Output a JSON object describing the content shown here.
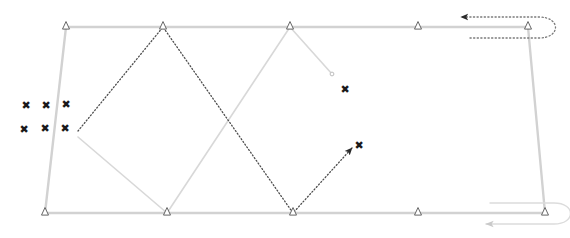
{
  "diagram": {
    "background_color": "#ffffff",
    "canvas": {
      "width": 570,
      "height": 238
    },
    "colors": {
      "boundary": "#d2d2d2",
      "pass_light": "#d8d8d8",
      "pass_dark": "#4d4d4d",
      "turn_dark": "#7a7a7a",
      "turn_light": "#dcdcdc",
      "marker_outline": "#555555",
      "marker_fill": "#ffffff",
      "obstacle": "#1a1a1a"
    }
  },
  "boundary": {
    "name": "field-boundary",
    "points": [
      {
        "x": 66,
        "y": 27
      },
      {
        "x": 528,
        "y": 27
      },
      {
        "x": 545,
        "y": 213
      },
      {
        "x": 45,
        "y": 213
      }
    ],
    "stroke_width": 2.4
  },
  "waypoints": {
    "top_row_label": "top-edge-waypoints",
    "bottom_row_label": "bottom-edge-waypoints",
    "top": [
      {
        "id": "t1",
        "x": 66,
        "y": 27
      },
      {
        "id": "t2",
        "x": 163,
        "y": 27
      },
      {
        "id": "t3",
        "x": 290,
        "y": 27
      },
      {
        "id": "t4",
        "x": 418,
        "y": 27
      },
      {
        "id": "t5",
        "x": 528,
        "y": 27
      }
    ],
    "bottom": [
      {
        "id": "b1",
        "x": 45,
        "y": 213
      },
      {
        "id": "b2",
        "x": 167,
        "y": 213
      },
      {
        "id": "b3",
        "x": 293,
        "y": 213
      },
      {
        "id": "b4",
        "x": 418,
        "y": 213
      },
      {
        "id": "b5",
        "x": 545,
        "y": 213
      }
    ],
    "marker_shape": "triangle-up-outline",
    "marker_size": 7
  },
  "coverage_paths": [
    {
      "name": "coverage-pass-light",
      "style": "solid",
      "color": "#d8d8d8",
      "stroke_width": 1.6,
      "points": [
        {
          "x": 78,
          "y": 137
        },
        {
          "x": 167,
          "y": 213
        },
        {
          "x": 290,
          "y": 27
        },
        {
          "x": 332,
          "y": 74
        }
      ],
      "end_marker": "dot",
      "end_point": {
        "x": 332,
        "y": 74
      }
    },
    {
      "name": "coverage-pass-dark",
      "style": "dotted",
      "color": "#4d4d4d",
      "stroke_width": 1.3,
      "points": [
        {
          "x": 78,
          "y": 131
        },
        {
          "x": 163,
          "y": 27
        },
        {
          "x": 293,
          "y": 213
        },
        {
          "x": 352,
          "y": 148
        }
      ],
      "end_marker": "arrow",
      "end_point": {
        "x": 352,
        "y": 148
      }
    }
  ],
  "turns": [
    {
      "name": "headland-turn-top-right",
      "style": "dotted",
      "color": "#7a7a7a",
      "stroke_width": 1.3,
      "outbound_y": 38,
      "return_y": 17,
      "start_x": 470,
      "apex_x": 553,
      "arrow_tip": {
        "x": 461,
        "y": 17
      },
      "direction": "left"
    },
    {
      "name": "headland-turn-bottom-right",
      "style": "solid",
      "color": "#dcdcdc",
      "stroke_width": 1.4,
      "outbound_y": 203,
      "return_y": 224,
      "start_x": 490,
      "apex_x": 568,
      "arrow_tip": {
        "x": 486,
        "y": 224
      },
      "direction": "left"
    }
  ],
  "obstacles": {
    "name": "obstacle-markers",
    "glyph": "✖",
    "cluster": [
      {
        "id": "x1",
        "x": 26,
        "y": 105
      },
      {
        "id": "x2",
        "x": 46,
        "y": 105
      },
      {
        "id": "x3",
        "x": 66,
        "y": 104
      },
      {
        "id": "x4",
        "x": 24,
        "y": 129
      },
      {
        "id": "x5",
        "x": 45,
        "y": 128
      },
      {
        "id": "x6",
        "x": 65,
        "y": 128
      }
    ],
    "endpoints": [
      {
        "id": "x7",
        "x": 345,
        "y": 89
      },
      {
        "id": "x8",
        "x": 359,
        "y": 145
      }
    ]
  }
}
